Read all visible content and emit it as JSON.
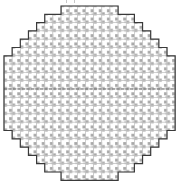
{
  "grid": {
    "origin_x": 4,
    "origin_y": 6,
    "cell_w": 8.15,
    "cell_h": 8.3,
    "rows": 21,
    "cols": 21,
    "row_extents": [
      [
        7,
        13
      ],
      [
        5,
        15
      ],
      [
        4,
        16
      ],
      [
        3,
        17
      ],
      [
        2,
        18
      ],
      [
        1,
        19
      ],
      [
        0,
        20
      ],
      [
        0,
        20
      ],
      [
        0,
        20
      ],
      [
        0,
        20
      ],
      [
        0,
        20
      ],
      [
        0,
        20
      ],
      [
        0,
        20
      ],
      [
        0,
        20
      ],
      [
        0,
        20
      ],
      [
        1,
        19
      ],
      [
        2,
        18
      ],
      [
        3,
        17
      ],
      [
        4,
        16
      ],
      [
        5,
        15
      ],
      [
        7,
        13
      ]
    ]
  },
  "colors": {
    "outline": "#3a3a3a",
    "cell_border": "#bdbdbd",
    "die_fill": "#ffffff",
    "die_pattern": "#a8a8a8",
    "center_line": "#555555"
  },
  "notches": [
    {
      "x": 66,
      "y": 0
    },
    {
      "x": 74,
      "y": 0
    }
  ]
}
